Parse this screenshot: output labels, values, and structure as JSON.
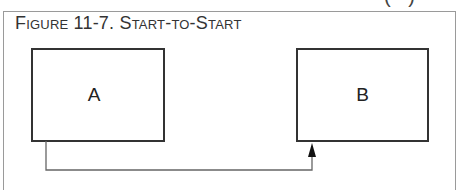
{
  "figure": {
    "title": "Figure 11-7. Start-to-Start",
    "cut_text_above": "",
    "cut_paren_above": "( )",
    "type": "start-to-start dependency"
  },
  "nodes": [
    {
      "id": "A",
      "label": "A"
    },
    {
      "id": "B",
      "label": "B"
    }
  ],
  "edges": [
    {
      "from": "A",
      "to": "B",
      "from_anchor": "start (bottom-left)",
      "to_anchor": "start (bottom-left)",
      "arrow": "end"
    }
  ],
  "colors": {
    "frame_border": "#9a9a9a",
    "box_border": "#333333",
    "connector": "#666666",
    "text": "#333333"
  }
}
